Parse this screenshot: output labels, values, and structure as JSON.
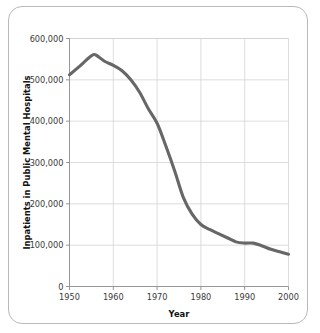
{
  "card": {
    "name": "chart-card"
  },
  "chart_data": {
    "type": "line",
    "title": "",
    "xlabel": "Year",
    "ylabel": "Inpatients in Public Mental Hospitals",
    "xlim": [
      1950,
      2000
    ],
    "ylim": [
      0,
      600000
    ],
    "grid": true,
    "legend": false,
    "line_color": "#676767",
    "grid_color": "#cfcfcf",
    "axis_color": "#8c8c8c",
    "xticks": [
      1950,
      1960,
      1970,
      1980,
      1990,
      2000
    ],
    "xtick_labels": [
      "1950",
      "1960",
      "1970",
      "1980",
      "1990",
      "2000"
    ],
    "yticks": [
      0,
      100000,
      200000,
      300000,
      400000,
      500000,
      600000
    ],
    "ytick_labels": [
      "0",
      "100,000",
      "200,000",
      "300,000",
      "400,000",
      "500,000",
      "600,000"
    ],
    "series": [
      {
        "name": "Inpatients in Public Mental Hospitals",
        "x": [
          1950,
          1952,
          1955,
          1956,
          1958,
          1960,
          1962,
          1964,
          1966,
          1968,
          1970,
          1972,
          1974,
          1976,
          1978,
          1980,
          1982,
          1984,
          1986,
          1988,
          1990,
          1992,
          1994,
          1996,
          1998,
          2000
        ],
        "values": [
          512000,
          530000,
          558000,
          560000,
          545000,
          535000,
          522000,
          500000,
          470000,
          430000,
          395000,
          340000,
          280000,
          215000,
          175000,
          150000,
          138000,
          128000,
          118000,
          108000,
          105000,
          105000,
          98000,
          90000,
          84000,
          78000
        ]
      }
    ]
  }
}
